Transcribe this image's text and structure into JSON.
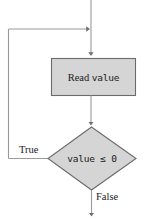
{
  "diagram": {
    "type": "flowchart",
    "background_color": "#ffffff",
    "node_fill_color": "#d5d5d5",
    "node_stroke_color": "#6b6b6b",
    "edge_color": "#8c8c8c",
    "text_color": "#1a1a1a",
    "nodes": [
      {
        "id": "process-read",
        "shape": "rectangle",
        "label_prefix": "Read",
        "label_code": "value",
        "label_full": "Read value"
      },
      {
        "id": "decision-check",
        "shape": "diamond",
        "label": "value ≤ 0"
      }
    ],
    "edges": [
      {
        "id": "entry-edge",
        "label": "",
        "from": "top",
        "to": "process-read"
      },
      {
        "id": "process-to-decision",
        "label": "",
        "from": "process-read",
        "to": "decision-check"
      },
      {
        "id": "true-branch",
        "label": "True",
        "from": "decision-check",
        "to": "entry-edge"
      },
      {
        "id": "false-branch",
        "label": "False",
        "from": "decision-check",
        "to": "bottom"
      }
    ]
  }
}
